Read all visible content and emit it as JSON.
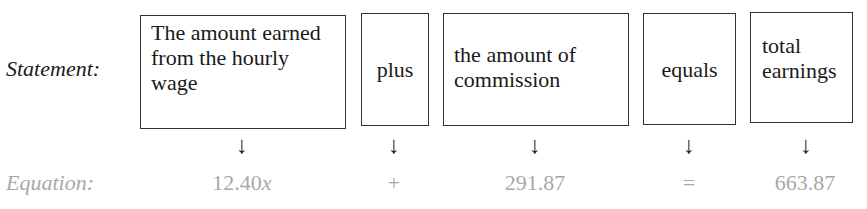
{
  "statement_label": "Statement:",
  "equation_label": "Equation:",
  "boxes": [
    {
      "text": "The amount earned from the hourly wage"
    },
    {
      "text": "plus"
    },
    {
      "text": "the amount of commission"
    },
    {
      "text": "equals"
    },
    {
      "text": "total earnings"
    }
  ],
  "arrow_glyph": "↓",
  "equation_parts": [
    {
      "text": "12.40",
      "var": "x"
    },
    {
      "text": "+"
    },
    {
      "text": "291.87"
    },
    {
      "text": "="
    },
    {
      "text": "663.87"
    }
  ],
  "colors": {
    "equation_text": "#a8a8a8",
    "border": "#333333"
  }
}
